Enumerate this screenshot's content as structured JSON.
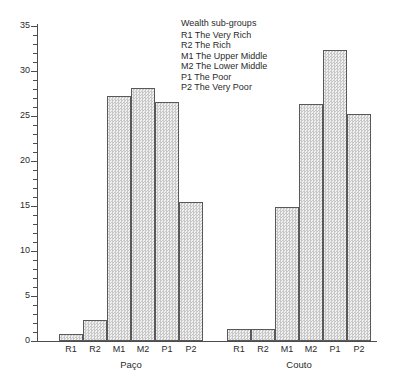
{
  "chart_data": {
    "type": "bar",
    "title": "",
    "subtitle": "",
    "xlabel": "",
    "ylabel": "",
    "ylim": [
      0,
      35
    ],
    "y_major_step": 5,
    "y_minor_step": 1,
    "grid": false,
    "legend_position": "top-center",
    "legend_title": "Wealth sub-groups",
    "categories": [
      "R1",
      "R2",
      "M1",
      "M2",
      "P1",
      "P2"
    ],
    "groups": [
      "Paço",
      "Couto"
    ],
    "series": [
      {
        "name": "Paço",
        "values": [
          0.8,
          2.3,
          27.2,
          28.1,
          26.6,
          15.4
        ]
      },
      {
        "name": "Couto",
        "values": [
          1.3,
          1.3,
          14.9,
          26.3,
          32.3,
          25.2
        ]
      }
    ],
    "ytick_labels": [
      "0",
      "5",
      "10",
      "15",
      "20",
      "25",
      "30",
      "35"
    ],
    "ytick_values": [
      0,
      5,
      10,
      15,
      20,
      25,
      30,
      35
    ],
    "legend_entries": [
      {
        "code": "R1",
        "label": "R1 The Very Rich"
      },
      {
        "code": "R2",
        "label": "R2 The Rich"
      },
      {
        "code": "M1",
        "label": "M1 The Upper Middle"
      },
      {
        "code": "M2",
        "label": "M2 The Lower Middle"
      },
      {
        "code": "P1",
        "label": "P1 The Poor"
      },
      {
        "code": "P2",
        "label": "P2 The Very Poor"
      }
    ],
    "colors": {
      "bar_fill": "#dcdcdc",
      "bar_edge": "#595959",
      "axis": "#4d4d4d",
      "text": "#2b2b2b",
      "background": "#ffffff"
    }
  }
}
